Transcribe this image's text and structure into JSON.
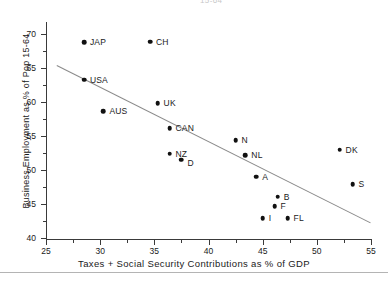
{
  "chart_data": {
    "type": "scatter",
    "title": "",
    "xlabel": "Taxes + Social Security Contributions as % of GDP",
    "ylabel": "Business Employment as % of Pop 15-64",
    "xlim": [
      25,
      55
    ],
    "ylim": [
      40,
      71.5
    ],
    "xticks": [
      25,
      30,
      35,
      40,
      45,
      50,
      55
    ],
    "yticks": [
      40,
      45,
      50,
      55,
      60,
      65,
      70
    ],
    "xminorticks": [
      27.5,
      32.5,
      37.5,
      42.5,
      47.5,
      52.5
    ],
    "yminorticks": [
      42.5,
      47.5,
      52.5,
      57.5,
      62.5,
      67.5
    ],
    "grid": false,
    "legend": false,
    "points": [
      {
        "label": "JAP",
        "x": 28.5,
        "y": 68.8,
        "label_pos": "right"
      },
      {
        "label": "CH",
        "x": 34.6,
        "y": 68.9,
        "label_pos": "right"
      },
      {
        "label": "USA",
        "x": 28.5,
        "y": 63.3,
        "label_pos": "right"
      },
      {
        "label": "UK",
        "x": 35.3,
        "y": 59.8,
        "label_pos": "right"
      },
      {
        "label": "AUS",
        "x": 30.3,
        "y": 58.7,
        "label_pos": "right"
      },
      {
        "label": "CAN",
        "x": 36.4,
        "y": 56.2,
        "label_pos": "right"
      },
      {
        "label": "N",
        "x": 42.5,
        "y": 54.4,
        "label_pos": "right"
      },
      {
        "label": "DK",
        "x": 52.1,
        "y": 53.0,
        "label_pos": "right"
      },
      {
        "label": "NZ",
        "x": 36.4,
        "y": 52.4,
        "label_pos": "right"
      },
      {
        "label": "NL",
        "x": 43.4,
        "y": 52.2,
        "label_pos": "right"
      },
      {
        "label": "D",
        "x": 37.5,
        "y": 51.5,
        "label_pos": "right-low"
      },
      {
        "label": "A",
        "x": 44.4,
        "y": 49.0,
        "label_pos": "right"
      },
      {
        "label": "S",
        "x": 53.3,
        "y": 47.9,
        "label_pos": "right"
      },
      {
        "label": "B",
        "x": 46.4,
        "y": 46.1,
        "label_pos": "right"
      },
      {
        "label": "F",
        "x": 46.1,
        "y": 44.7,
        "label_pos": "right"
      },
      {
        "label": "I",
        "x": 45.0,
        "y": 42.9,
        "label_pos": "right"
      },
      {
        "label": "FL",
        "x": 47.3,
        "y": 42.9,
        "label_pos": "right"
      }
    ],
    "trendline": {
      "x1": 26.0,
      "y1": 65.5,
      "x2": 55.0,
      "y2": 42.3,
      "color": "#8a8a8a"
    }
  },
  "clipped_header": "15-64"
}
